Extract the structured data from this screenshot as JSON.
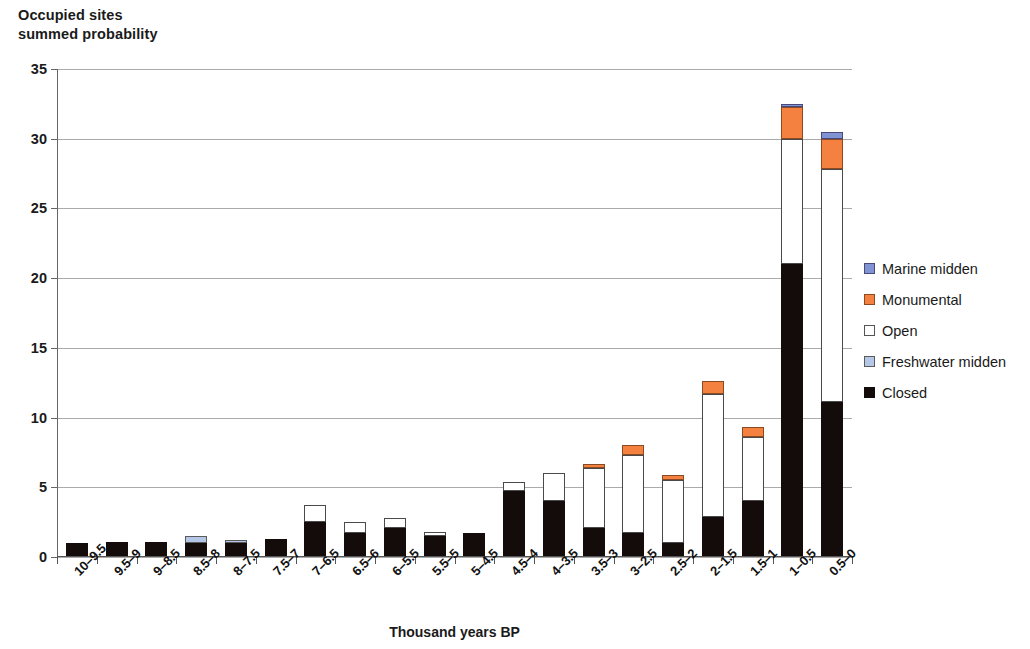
{
  "chart_data": {
    "type": "bar",
    "stacked": true,
    "title": "Occupied sites\nsummed probability",
    "xlabel": "Thousand years BP",
    "ylabel": "",
    "ylim": [
      0,
      35
    ],
    "yticks": [
      0,
      5,
      10,
      15,
      20,
      25,
      30,
      35
    ],
    "grid": true,
    "legend_position": "right",
    "categories": [
      "10–9.5",
      "9.5–9",
      "9–8.5",
      "8.5–8",
      "8–7.5",
      "7.5–7",
      "7–6.5",
      "6.5–6",
      "6–5.5",
      "5.5–5",
      "5–4.5",
      "4.5–4",
      "4–3.5",
      "3.5–3",
      "3–2.5",
      "2.5–2",
      "2–1.5",
      "1.5–1",
      "1–0.5",
      "0.5–0"
    ],
    "series": [
      {
        "name": "Closed",
        "color": "#130c0a",
        "values": [
          1.0,
          1.05,
          1.1,
          1.0,
          1.0,
          1.3,
          2.5,
          1.7,
          2.1,
          1.5,
          1.7,
          4.7,
          4.0,
          2.1,
          1.75,
          1.0,
          2.9,
          4.0,
          21.0,
          11.1
        ]
      },
      {
        "name": "Freshwater midden",
        "color": "#b4c7e7",
        "values": [
          0,
          0,
          0,
          0.5,
          0.2,
          0,
          0,
          0,
          0,
          0,
          0,
          0,
          0,
          0,
          0,
          0,
          0,
          0,
          0,
          0
        ]
      },
      {
        "name": "Open",
        "color": "#ffffff",
        "values": [
          0,
          0,
          0,
          0,
          0,
          0,
          1.2,
          0.8,
          0.7,
          0.3,
          0,
          0.7,
          2.0,
          4.3,
          5.55,
          4.5,
          8.8,
          4.6,
          9.0,
          16.7
        ]
      },
      {
        "name": "Monumental",
        "color": "#f4813f",
        "values": [
          0,
          0,
          0,
          0,
          0,
          0,
          0,
          0,
          0,
          0,
          0,
          0,
          0,
          0.3,
          0.7,
          0.4,
          0.9,
          0.7,
          2.3,
          2.2
        ]
      },
      {
        "name": "Marine midden",
        "color": "#8094d4",
        "values": [
          0,
          0,
          0,
          0,
          0,
          0,
          0,
          0,
          0,
          0,
          0,
          0,
          0,
          0,
          0,
          0,
          0,
          0,
          0.2,
          0.5
        ]
      }
    ],
    "totals": [
      1.0,
      1.05,
      1.1,
      1.5,
      1.2,
      1.3,
      3.7,
      2.5,
      2.8,
      1.8,
      1.7,
      5.4,
      6.0,
      6.7,
      8.0,
      5.9,
      12.6,
      9.3,
      32.5,
      30.5
    ]
  },
  "legend": {
    "items": [
      {
        "label": "Marine midden",
        "swatch": "sw-marine"
      },
      {
        "label": "Monumental",
        "swatch": "sw-monument"
      },
      {
        "label": "Open",
        "swatch": "sw-open"
      },
      {
        "label": "Freshwater midden",
        "swatch": "sw-fresh"
      },
      {
        "label": "Closed",
        "swatch": "sw-closed"
      }
    ]
  }
}
